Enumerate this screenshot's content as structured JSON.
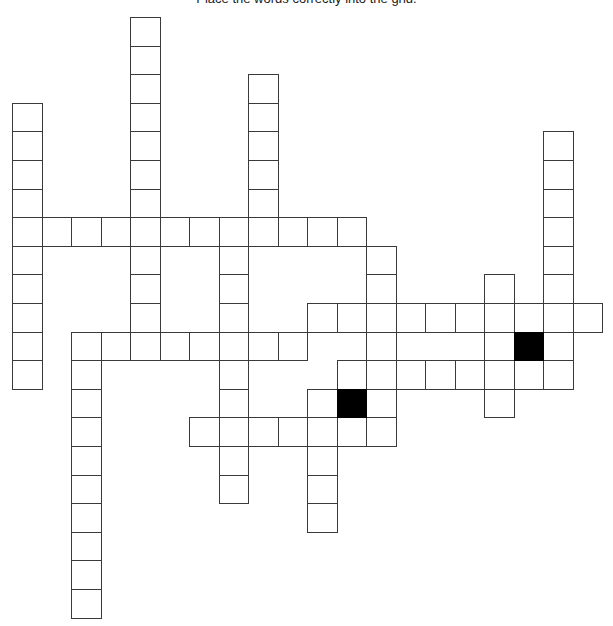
{
  "puzzle": {
    "instruction": "Place the words correctly into the grid.",
    "grid": {
      "origin_x": 12,
      "origin_y": 17,
      "cell_w": 29.5,
      "cell_h": 28.6,
      "colors": {
        "cell_border": "#3a3a3a",
        "cell_fill": "#ffffff",
        "block": "#000000"
      },
      "words": [
        {
          "dir": "down",
          "col": 0,
          "row": 3,
          "len": 10
        },
        {
          "dir": "down",
          "col": 4,
          "row": 0,
          "len": 12
        },
        {
          "dir": "down",
          "col": 8,
          "row": 2,
          "len": 6
        },
        {
          "dir": "across",
          "col": 0,
          "row": 7,
          "len": 12
        },
        {
          "dir": "down",
          "col": 7,
          "row": 7,
          "len": 10
        },
        {
          "dir": "down",
          "col": 12,
          "row": 8,
          "len": 7
        },
        {
          "dir": "across",
          "col": 10,
          "row": 10,
          "len": 10
        },
        {
          "dir": "across",
          "col": 2,
          "row": 11,
          "len": 8
        },
        {
          "dir": "down",
          "col": 2,
          "row": 11,
          "len": 10
        },
        {
          "dir": "across",
          "col": 11,
          "row": 12,
          "len": 8
        },
        {
          "dir": "across",
          "col": 6,
          "row": 14,
          "len": 7
        },
        {
          "dir": "down",
          "col": 10,
          "row": 13,
          "len": 5
        },
        {
          "dir": "down",
          "col": 11,
          "row": 12,
          "len": 3
        },
        {
          "dir": "down",
          "col": 16,
          "row": 9,
          "len": 5
        },
        {
          "dir": "down",
          "col": 18,
          "row": 4,
          "len": 9
        },
        {
          "dir": "down",
          "col": 17,
          "row": 10,
          "len": 3
        }
      ],
      "black_cells": [
        {
          "col": 11,
          "row": 13
        },
        {
          "col": 17,
          "row": 11
        }
      ]
    }
  }
}
